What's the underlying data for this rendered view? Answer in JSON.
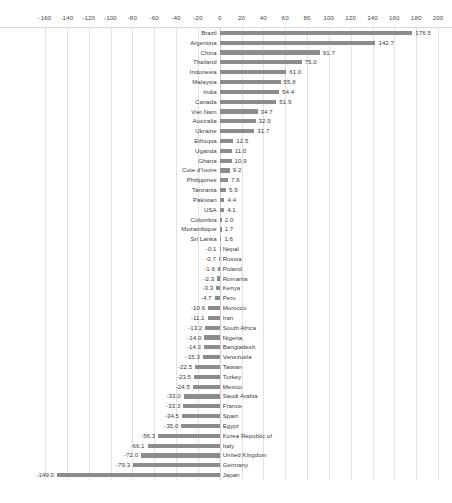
{
  "chart_data": {
    "type": "bar",
    "orientation": "horizontal",
    "title": "",
    "subtitle": "",
    "xlabel": "",
    "ylabel": "",
    "xlim": [
      -160,
      200
    ],
    "xticks": [
      -160,
      -140,
      -120,
      -100,
      -80,
      -60,
      -40,
      -20,
      0,
      20,
      40,
      60,
      80,
      100,
      120,
      140,
      160,
      180,
      200
    ],
    "xtick_labels": [
      "-160",
      "-140",
      "-120",
      "-100",
      "-80",
      "-60",
      "-40",
      "-20",
      "0",
      "20",
      "40",
      "60",
      "80",
      "100",
      "120",
      "140",
      "160",
      "180",
      "200"
    ],
    "grid": true,
    "grid_axis": "x",
    "legend": false,
    "bar_color": "#8c8c8c",
    "value_label_format": "one-decimal",
    "categories": [
      "Brazil",
      "Argentina",
      "China",
      "Thailand",
      "Indonesia",
      "Malaysia",
      "India",
      "Canada",
      "Viet Nam",
      "Australia",
      "Ukraine",
      "Ethiopia",
      "Uganda",
      "Ghana",
      "Cote d'Ivoire",
      "Philippines",
      "Tanzania",
      "Pakistan",
      "USA",
      "Colombia",
      "Mozambique",
      "Sri Lanka",
      "Nepal",
      "Russia",
      "Poland",
      "Romania",
      "Kenya",
      "Peru",
      "Morocco",
      "Iran",
      "South Africa",
      "Nigeria",
      "Bangladesh",
      "Venezuela",
      "Taiwan",
      "Turkey",
      "Mexico",
      "Saudi Arabia",
      "France",
      "Spain",
      "Egypt",
      "Korea Republic of",
      "Italy",
      "United Kingdom",
      "Germany",
      "Japan"
    ],
    "values": [
      176.5,
      142.7,
      91.7,
      75.0,
      61.0,
      55.8,
      54.4,
      51.9,
      34.7,
      32.9,
      31.7,
      12.5,
      11.0,
      10.9,
      9.2,
      7.6,
      5.9,
      4.4,
      4.1,
      2.0,
      1.7,
      1.6,
      -0.1,
      -0.7,
      -1.6,
      -2.3,
      -3.3,
      -4.7,
      -10.6,
      -11.1,
      -13.2,
      -14.0,
      -14.3,
      -15.3,
      -22.5,
      -23.5,
      -24.5,
      -33.0,
      -33.3,
      -34.5,
      -35.0,
      -56.3,
      -66.1,
      -72.0,
      -79.3,
      -149.0
    ],
    "value_labels": [
      "176.5",
      "142.7",
      "91.7",
      "75.0",
      "61.0",
      "55.8",
      "54.4",
      "51.9",
      "34.7",
      "32.9",
      "31.7",
      "12.5",
      "11.0",
      "10.9",
      "9.2",
      "7.6",
      "5.9",
      "4.4",
      "4.1",
      "2.0",
      "1.7",
      "1.6",
      "-0.1",
      "-0.7",
      "-1.6",
      "-2.3",
      "-3.3",
      "-4.7",
      "-10.6",
      "-11.1",
      "-13.2",
      "-14.0",
      "-14.3",
      "-15.3",
      "-22.5",
      "-23.5",
      "-24.5",
      "-33.0",
      "-33.3",
      "-34.5",
      "-35.0",
      "-56.3",
      "-66.1",
      "-72.0",
      "-79.3",
      "-149.0"
    ]
  },
  "caption": ""
}
